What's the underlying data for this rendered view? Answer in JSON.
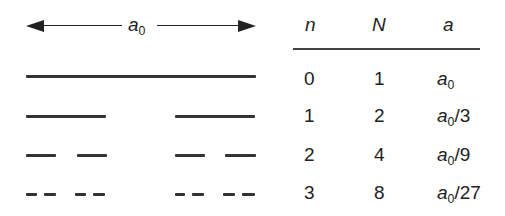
{
  "dimension_label": {
    "base": "a",
    "sub": "0"
  },
  "table": {
    "headers": [
      "n",
      "N",
      "a"
    ],
    "rows": [
      {
        "n": "0",
        "N": "1",
        "a_base": "a",
        "a_sub": "0",
        "a_suffix": ""
      },
      {
        "n": "1",
        "N": "2",
        "a_base": "a",
        "a_sub": "0",
        "a_suffix": "/3"
      },
      {
        "n": "2",
        "N": "4",
        "a_base": "a",
        "a_sub": "0",
        "a_suffix": "/9"
      },
      {
        "n": "3",
        "N": "8",
        "a_base": "a",
        "a_sub": "0",
        "a_suffix": "/27"
      }
    ]
  },
  "cantor_levels": [
    {
      "n": 0,
      "segments": [
        [
          26,
          256
        ]
      ],
      "y": 75
    },
    {
      "n": 1,
      "segments": [
        [
          26,
          106
        ],
        [
          175,
          255
        ]
      ],
      "y": 115
    },
    {
      "n": 2,
      "segments": [
        [
          26,
          56
        ],
        [
          77,
          107
        ],
        [
          175,
          205
        ],
        [
          225,
          256
        ]
      ],
      "y": 154
    },
    {
      "n": 3,
      "segments": [
        [
          26,
          37
        ],
        [
          44,
          56
        ],
        [
          75,
          86
        ],
        [
          93,
          105
        ],
        [
          175,
          185
        ],
        [
          192,
          204
        ],
        [
          223,
          235
        ],
        [
          242,
          255
        ]
      ],
      "y": 193
    }
  ],
  "colors": {
    "ink": "#333333",
    "background": "#ffffff"
  }
}
